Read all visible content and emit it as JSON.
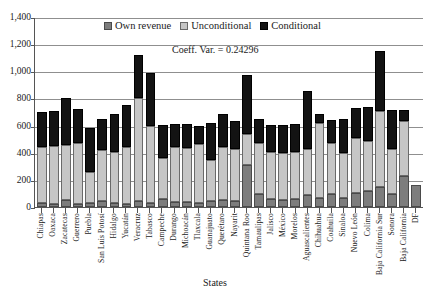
{
  "legend": {
    "position": "top-center",
    "items": [
      {
        "label": "Own revenue",
        "key": "own_revenue",
        "color": "#7d7d7d",
        "icon": "square-swatch-icon"
      },
      {
        "label": "Unconditional",
        "key": "unconditional",
        "color": "#c6c6c6",
        "icon": "square-swatch-icon"
      },
      {
        "label": "Conditional",
        "key": "conditional",
        "color": "#131313",
        "icon": "square-swatch-icon"
      }
    ]
  },
  "annotation": {
    "text": "Coeff. Var. = 0.24296",
    "label": "Coeff. Var.",
    "value": "0.24296"
  },
  "axes": {
    "x_title": "States",
    "y_title": "",
    "y_ticks": [
      "0",
      "200",
      "400",
      "600",
      "800",
      "1,000",
      "1,200",
      "1,400"
    ]
  },
  "chart_data": {
    "type": "bar",
    "stacked": true,
    "title": "",
    "subtitle": "",
    "xlabel": "States",
    "ylabel": "",
    "ylim": [
      0,
      1400
    ],
    "ytick_step": 200,
    "grid": true,
    "legend_position": "top-center",
    "annotations": [
      {
        "text": "Coeff. Var. = 0.24296",
        "x": "center",
        "y": 1150
      }
    ],
    "categories": [
      "Chiapas",
      "Oaxaca",
      "Zacatecas",
      "Guerrero",
      "Puebla",
      "San Luis Potosí",
      "Hidalgo",
      "Yucatán",
      "Veracruz",
      "Tabasco",
      "Campeche",
      "Durango",
      "Michoacán",
      "Tlaxcala",
      "Guanajuato",
      "Querétaro",
      "Nayarit",
      "Quintana Roo",
      "Tamaulipas",
      "Jalisco",
      "México",
      "Morelos",
      "Aguascalientes",
      "Chihuahua",
      "Coahuila",
      "Sinaloa",
      "Nuevo León",
      "Colima",
      "Baja California Sur",
      "Sonora",
      "Baja California",
      "DF"
    ],
    "series": [
      {
        "name": "Own revenue",
        "color": "#7d7d7d",
        "values": [
          30,
          25,
          55,
          20,
          30,
          45,
          30,
          25,
          45,
          30,
          60,
          40,
          35,
          30,
          45,
          55,
          45,
          310,
          95,
          60,
          55,
          60,
          85,
          70,
          95,
          70,
          105,
          115,
          150,
          95,
          230,
          160
        ]
      },
      {
        "name": "Unconditional",
        "color": "#c6c6c6",
        "values": [
          410,
          425,
          400,
          450,
          230,
          375,
          375,
          415,
          755,
          570,
          300,
          400,
          400,
          435,
          305,
          385,
          385,
          230,
          380,
          345,
          345,
          345,
          340,
          550,
          375,
          330,
          400,
          370,
          560,
          330,
          405,
          0
        ]
      },
      {
        "name": "Conditional",
        "color": "#131313",
        "values": [
          260,
          260,
          350,
          255,
          320,
          230,
          280,
          315,
          320,
          390,
          245,
          175,
          180,
          130,
          270,
          245,
          205,
          430,
          170,
          200,
          205,
          205,
          430,
          65,
          170,
          250,
          225,
          250,
          440,
          290,
          80,
          0
        ]
      }
    ],
    "totals": [
      700,
      710,
      805,
      725,
      580,
      650,
      685,
      755,
      1120,
      990,
      605,
      615,
      615,
      595,
      620,
      685,
      635,
      970,
      645,
      605,
      605,
      610,
      855,
      685,
      640,
      650,
      730,
      735,
      1150,
      715,
      715,
      160
    ]
  }
}
